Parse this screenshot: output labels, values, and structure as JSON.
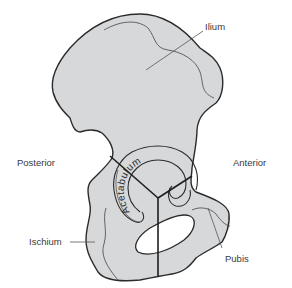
{
  "diagram": {
    "colors": {
      "bone_fill": "#d6d8da",
      "outline": "#2b2b2b",
      "leader": "#555555",
      "text": "#3a3a3a"
    },
    "labels": {
      "ilium": "Ilium",
      "posterior": "Posterior",
      "anterior": "Anterior",
      "acetabulum": "Acetabulum",
      "ischium": "Ischium",
      "pubis": "Pubis"
    }
  }
}
